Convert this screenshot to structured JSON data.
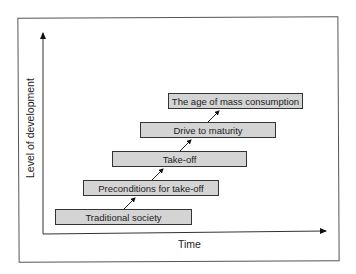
{
  "diagram": {
    "title": "",
    "x_axis_label": "Time",
    "y_axis_label": "Level of development",
    "stages": [
      {
        "label": "Traditional society"
      },
      {
        "label": "Preconditions for take-off"
      },
      {
        "label": "Take-off"
      },
      {
        "label": "Drive to maturity"
      },
      {
        "label": "The age of mass consumption"
      }
    ],
    "colors": {
      "box_fill": "#d4d4d4",
      "line": "#222222",
      "background": "#ffffff"
    }
  }
}
